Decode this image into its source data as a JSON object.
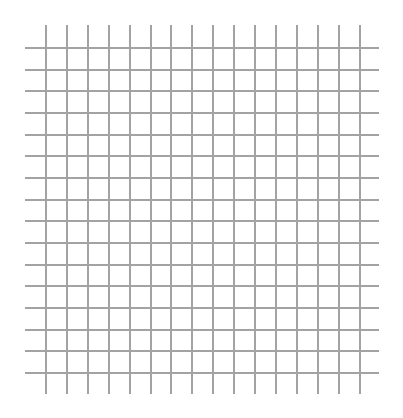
{
  "grid": {
    "line_color": "#a3a3a3",
    "line_width": 2,
    "horizontal": {
      "count": 16,
      "first_y": 47,
      "spacing": 21.67,
      "x_start": 25,
      "x_end": 379
    },
    "vertical": {
      "count": 16,
      "first_x": 45,
      "spacing": 20.9,
      "y_start": 25,
      "y_end": 394
    }
  }
}
